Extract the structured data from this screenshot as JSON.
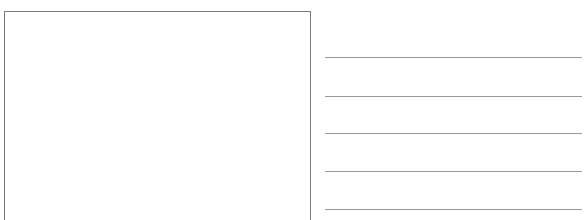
{
  "worksheet": {
    "drawing_box": {
      "label": "",
      "border_color": "#7a7a7a"
    },
    "writing_lines": {
      "count": 5,
      "line_color": "#9a9a9a",
      "positions_y": [
        57,
        96,
        133,
        171,
        209
      ],
      "lines": [
        {
          "text": ""
        },
        {
          "text": ""
        },
        {
          "text": ""
        },
        {
          "text": ""
        },
        {
          "text": ""
        }
      ]
    }
  }
}
